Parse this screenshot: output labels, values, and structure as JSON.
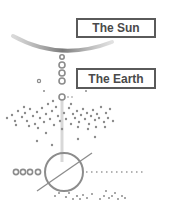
{
  "labels": {
    "sun": "The Sun",
    "earth": "The Earth"
  },
  "colors": {
    "foreground": "#8c8c8c",
    "label_border": "#5a5a5a",
    "label_text": "#4a4a4a",
    "line": "#cfcfcf"
  },
  "elements": {
    "sun_arc": "curved gray arc representing the Sun",
    "chain_circles": 4,
    "left_circles": 4,
    "big_circle": "circle crossed by diagonal line",
    "dotted_line": "horizontal dotted line"
  }
}
